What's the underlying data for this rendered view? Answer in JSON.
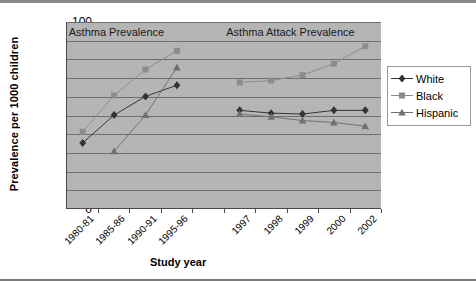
{
  "chart_data": {
    "type": "line",
    "title": "",
    "xlabel": "Study year",
    "ylabel": "Prevalence per 1000 children",
    "ylim": [
      0,
      100
    ],
    "ytick_step": 10,
    "yticks": [
      100,
      90,
      80,
      70,
      60,
      50,
      40,
      30,
      20,
      10,
      0
    ],
    "grid": true,
    "legend_position": "right",
    "plot_background": "#b5b5b5",
    "categories": [
      "1980-81",
      "1985-86",
      "1990-91",
      "1995-96",
      "",
      "1997",
      "1998",
      "1999",
      "2000",
      "2002"
    ],
    "annotations": [
      {
        "text": "Asthma Prevalence",
        "category_span": [
          "1980-81",
          "1995-96"
        ]
      },
      {
        "text": "Asthma Attack Prevalence",
        "category_span": [
          "1997",
          "2002"
        ]
      }
    ],
    "series": [
      {
        "name": "White",
        "marker": "diamond",
        "color": "#333333",
        "values": [
          35,
          50,
          60,
          66,
          null,
          52.5,
          51,
          50.5,
          52.5,
          52.5
        ]
      },
      {
        "name": "Black",
        "marker": "square",
        "color": "#8c8c8c",
        "values": [
          41,
          60.5,
          74.5,
          84.5,
          null,
          67.5,
          68.5,
          71.5,
          77.5,
          87
        ]
      },
      {
        "name": "Hispanic",
        "marker": "triangle",
        "color": "#707070",
        "values": [
          null,
          30.5,
          50,
          75.5,
          null,
          50.5,
          49,
          47,
          46,
          44
        ]
      }
    ]
  },
  "legend": {
    "items": [
      {
        "label": "White"
      },
      {
        "label": "Black"
      },
      {
        "label": "Hispanic"
      }
    ]
  }
}
